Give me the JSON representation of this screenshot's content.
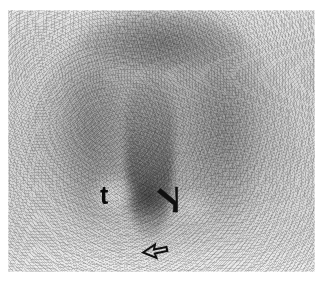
{
  "figure": {
    "modality": "nuclear medicine scintigraphy",
    "view": "posterior planar bone scan of the pelvis",
    "plate": {
      "x": 8,
      "y": 10,
      "width": 307,
      "height": 262,
      "background_color": "#d2d2d2",
      "page_background_color": "#ffffff"
    }
  },
  "annotations": {
    "tumor_label": {
      "text": "t",
      "semantic": "tumor-label",
      "color": "#0a0a0a",
      "x": 100,
      "y": 183,
      "font_size_px": 25,
      "weight": "bold"
    },
    "arrows": [
      {
        "name": "open-arrow-upper",
        "description": "open outline arrow pointing down-left toward midline uptake",
        "color": "#101010",
        "x": 152,
        "y": 183,
        "direction": "down-left"
      },
      {
        "name": "open-arrow-lower",
        "description": "open outline arrow pointing left toward inferior midline focus",
        "color": "#101010",
        "x": 134,
        "y": 237,
        "direction": "left"
      }
    ]
  },
  "image_features": [
    {
      "name": "superior-uptake-arc",
      "description": "dark arc of increased tracer uptake along the superior margin"
    },
    {
      "name": "left-paravertebral-band",
      "description": "vertical band of uptake on the left side"
    },
    {
      "name": "right-paravertebral-band",
      "description": "vertical band of uptake on the right side"
    },
    {
      "name": "midline-column",
      "description": "intense midline column of uptake"
    },
    {
      "name": "focal-hot-spot-inferior",
      "description": "focal area of intense inferior midline uptake"
    },
    {
      "name": "photopenic-lesion",
      "description": "photopenic (cold) defect marked by the letter t"
    },
    {
      "name": "inferior-washout",
      "description": "bright low-count region along the inferior border"
    }
  ]
}
